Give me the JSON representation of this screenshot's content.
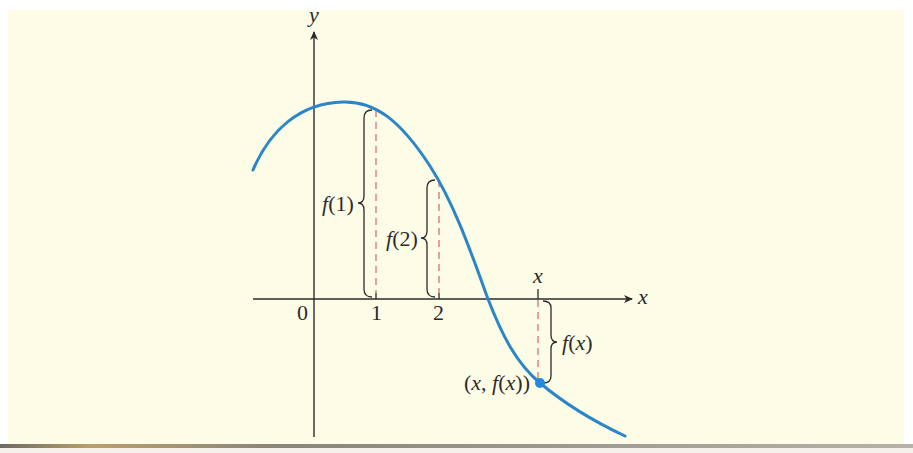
{
  "figure": {
    "axes": {
      "x_label": "x",
      "y_label": "y",
      "origin_label": "0",
      "ticks": [
        {
          "label": "1"
        },
        {
          "label": "2"
        }
      ],
      "moving_tick_label": "x"
    },
    "annotations": {
      "f1": "f(1)",
      "f2": "f(2)",
      "fx": "f(x)",
      "point": "(x, f(x))"
    },
    "colors": {
      "background": "#fdfce6",
      "curve": "#2a86c8",
      "axes": "#2b2b2b",
      "dashed_guides": "#d9636a",
      "point": "#1f8ae0"
    }
  },
  "chart_data": {
    "type": "line",
    "title": "",
    "xlabel": "x",
    "ylabel": "y",
    "marked_x": [
      "0",
      "1",
      "2",
      "x"
    ],
    "labels": [
      "f(1)",
      "f(2)",
      "f(x)",
      "(x, f(x))"
    ],
    "grid": false
  }
}
